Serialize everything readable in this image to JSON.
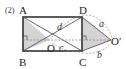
{
  "problem_number": "(2)",
  "points": {
    "A": "A",
    "B": "B",
    "C": "C",
    "D": "D",
    "O": "O",
    "O_prime": "O′"
  },
  "segment_labels": {
    "d": "d",
    "c": "c",
    "a": "a",
    "b": "b"
  },
  "colors": {
    "stroke": "#333333",
    "dashed": "#8a8a8a",
    "shade": "#d4d4d4"
  }
}
